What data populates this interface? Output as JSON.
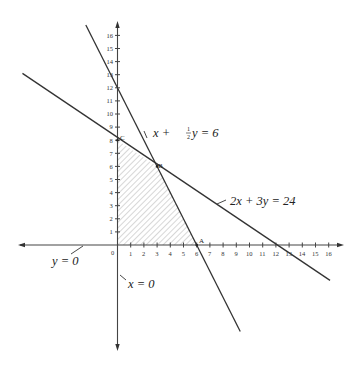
{
  "chart_data": {
    "type": "line",
    "title": "",
    "xlabel": "",
    "ylabel": "",
    "xlim": [
      -7.5,
      17
    ],
    "ylim": [
      -8,
      17
    ],
    "grid": false,
    "x_ticks": [
      0,
      1,
      2,
      3,
      4,
      5,
      6,
      7,
      8,
      9,
      10,
      11,
      12,
      13,
      14,
      15,
      16
    ],
    "y_ticks": [
      1,
      2,
      3,
      4,
      5,
      6,
      7,
      8,
      9,
      10,
      11,
      12,
      13,
      14,
      15,
      16
    ],
    "origin_label": "0",
    "series": [
      {
        "name": "x + ½y = 6",
        "equation": "2x + y = 12",
        "points": [
          [
            -2.4,
            16.8
          ],
          [
            9.3,
            -6.6
          ]
        ]
      },
      {
        "name": "2x + 3y = 24",
        "points": [
          [
            -7.2,
            13.1
          ],
          [
            16.1,
            -2.7
          ]
        ]
      },
      {
        "name": "y = 0",
        "note": "x-axis"
      },
      {
        "name": "x = 0",
        "note": "y-axis"
      }
    ],
    "feasible_region": {
      "shaded": true,
      "pattern": "diagonal hatch",
      "vertices": [
        [
          0,
          0
        ],
        [
          6,
          0
        ],
        [
          3,
          6
        ],
        [
          0,
          8
        ]
      ]
    },
    "annotations": [
      {
        "label": "A",
        "point": [
          6,
          0
        ]
      },
      {
        "label": "B",
        "point": [
          3,
          6
        ]
      },
      {
        "label": "C",
        "point": [
          0,
          8
        ]
      }
    ]
  },
  "labels": {
    "line1_prefix": "x + ",
    "line1_num": "1",
    "line1_den": "2",
    "line1_suffix": "y = 6",
    "line2": "2x + 3y = 24",
    "yzero": "y = 0",
    "xzero": "x = 0",
    "vertex_a": "A",
    "vertex_b": "B",
    "vertex_c": "C",
    "origin": "0"
  }
}
